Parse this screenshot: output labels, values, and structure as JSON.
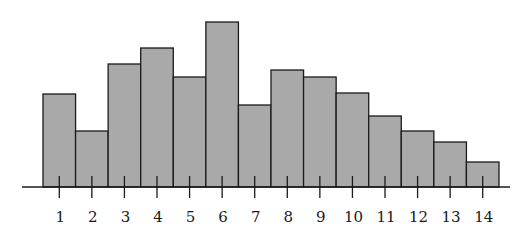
{
  "chart_data": {
    "type": "bar",
    "title": "",
    "xlabel": "",
    "ylabel": "",
    "categories": [
      "1",
      "2",
      "3",
      "4",
      "5",
      "6",
      "7",
      "8",
      "9",
      "10",
      "11",
      "12",
      "13",
      "14"
    ],
    "values": [
      93,
      56,
      123,
      139,
      110,
      165,
      82,
      117,
      110,
      94,
      71,
      56,
      45,
      25
    ],
    "value_units": "relative height (no y-axis shown)",
    "ylim": [
      0,
      165
    ],
    "grid": false,
    "legend": "none",
    "bar_color": "#a9a9a9",
    "edge_color": "#1a1a1a"
  }
}
